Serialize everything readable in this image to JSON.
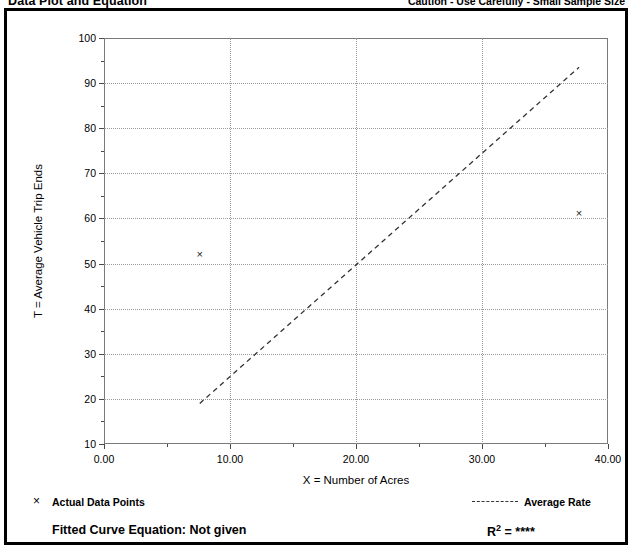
{
  "header": {
    "title": "Data Plot and Equation",
    "caution": "Caution - Use Carefully - Small Sample Size"
  },
  "legend": {
    "marker_glyph": "×",
    "marker_label": "Actual Data Points",
    "line_label": "Average Rate"
  },
  "equation": {
    "fitted_curve_label": "Fitted Curve Equation:  Not given",
    "rsq_base": "R",
    "rsq_exp": "2",
    "rsq_value": "= ****"
  },
  "chart_data": {
    "type": "scatter",
    "title": "Data Plot and Equation",
    "xlabel": "X = Number of Acres",
    "ylabel": "T = Average Vehicle Trip Ends",
    "xlim": [
      0.0,
      40.0
    ],
    "ylim": [
      10,
      100
    ],
    "xticks": [
      0.0,
      10.0,
      20.0,
      30.0,
      40.0
    ],
    "xtick_labels": [
      "0.00",
      "10.00",
      "20.00",
      "30.00",
      "40.00"
    ],
    "xminor_ticks": [
      5.0,
      15.0,
      25.0,
      35.0
    ],
    "yticks": [
      10,
      20,
      30,
      40,
      50,
      60,
      70,
      80,
      90,
      100
    ],
    "ytick_labels": [
      "10",
      "20",
      "30",
      "40",
      "50",
      "60",
      "70",
      "80",
      "90",
      "100"
    ],
    "yminor_ticks": [
      15,
      25,
      35,
      45,
      55,
      65,
      75,
      85,
      95
    ],
    "grid": "dotted-both",
    "legend_position": "below-plot",
    "points": [
      {
        "x": 7.6,
        "y": 52.0,
        "marker": "x"
      },
      {
        "x": 37.7,
        "y": 61.0,
        "marker": "x"
      }
    ],
    "series": [
      {
        "name": "Average Rate",
        "style": "dashed",
        "x": [
          7.6,
          37.7
        ],
        "y": [
          19.0,
          93.5
        ]
      }
    ],
    "annotations": {
      "fitted_curve_equation": "Not given",
      "r_squared": "****",
      "caution": "Caution - Use Carefully - Small Sample Size"
    }
  }
}
